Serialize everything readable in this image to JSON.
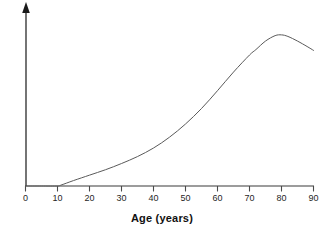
{
  "chart_data": {
    "type": "line",
    "title": "",
    "subtitle": "",
    "xlabel": "Age (years)",
    "ylabel": "",
    "xlim": [
      0,
      90
    ],
    "ylim": [
      0,
      1
    ],
    "xticks": [
      0,
      10,
      20,
      30,
      40,
      50,
      60,
      70,
      80,
      90
    ],
    "xtick_labels": [
      "0",
      "10",
      "20",
      "30",
      "40",
      "50",
      "60",
      "70",
      "80",
      "90"
    ],
    "yticks": [],
    "ytick_labels": [],
    "grid": false,
    "legend": null,
    "legend_position": "none",
    "annotations": [],
    "axis_style": {
      "y_axis_arrow": true,
      "x_axis_arrow": false,
      "axis_color": "#3a3a3a",
      "tick_direction": "down"
    },
    "series": [
      {
        "name": "risk",
        "color": "#5a5a5a",
        "line_width": 1,
        "x": [
          0,
          5,
          10,
          11,
          15,
          20,
          25,
          30,
          35,
          40,
          45,
          50,
          55,
          60,
          65,
          70,
          72,
          75,
          78,
          80,
          82,
          85,
          88,
          90
        ],
        "y": [
          0.0,
          0.0,
          0.0,
          0.005,
          0.035,
          0.07,
          0.105,
          0.145,
          0.19,
          0.245,
          0.315,
          0.4,
          0.5,
          0.615,
          0.735,
          0.845,
          0.88,
          0.935,
          0.97,
          0.975,
          0.965,
          0.935,
          0.9,
          0.875
        ]
      }
    ]
  },
  "axis": {
    "x_title": "Age (years)",
    "y_title": "",
    "tick_labels": [
      "0",
      "10",
      "20",
      "30",
      "40",
      "50",
      "60",
      "70",
      "80",
      "90"
    ]
  },
  "colors": {
    "background": "#ffffff",
    "axis": "#3a3a3a",
    "curve": "#5a5a5a",
    "text": "#1a1a1a"
  }
}
